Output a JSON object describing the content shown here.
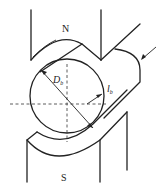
{
  "diagram": {
    "type": "magnetic-pole-rotor-schematic",
    "labels": {
      "north_pole": "N",
      "south_pole": "S",
      "diameter": "D",
      "diameter_sub": "b",
      "length": "l",
      "length_sub": "b"
    },
    "colors": {
      "line": "#222222",
      "background": "#ffffff"
    }
  }
}
